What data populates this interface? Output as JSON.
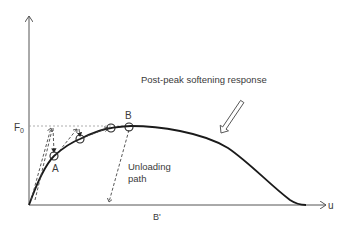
{
  "diagram": {
    "axes": {
      "y_label_value": "F",
      "y_label_subscript": "0",
      "x_label": "u",
      "x_marker": "B'"
    },
    "annotations": {
      "post_peak": "Post-peak softening response",
      "unloading_line1": "Unloading",
      "unloading_line2": "path"
    },
    "points": [
      {
        "label": "A"
      },
      {
        "label": "B"
      }
    ],
    "colors": {
      "curve": "#1a1a1a",
      "axis": "#555555",
      "dashed": "#444444",
      "text": "#3a3a3a"
    }
  }
}
